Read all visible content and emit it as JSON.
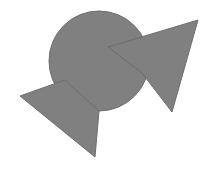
{
  "canvas": {
    "width": 216,
    "height": 174,
    "background_color": "#ffffff",
    "title": "Overlapping gray shapes figure"
  },
  "palette": {
    "shape_fill": "#808080",
    "shape_stroke": "#6e6e6e",
    "background": "#ffffff"
  },
  "shapes": [
    {
      "id": "circle",
      "name": "gray-circle",
      "type": "circle",
      "cx": 99,
      "cy": 61,
      "r": 50,
      "fill": "#808080",
      "stroke": "#6e6e6e",
      "stroke_width": 1
    },
    {
      "id": "right-arrow",
      "name": "gray-right-arrow",
      "type": "polygon",
      "points": "198,20 172,112 142,73 108,47",
      "fill": "#808080",
      "stroke": "#6e6e6e",
      "stroke_width": 1
    },
    {
      "id": "left-arrow",
      "name": "gray-left-arrow",
      "type": "polygon",
      "points": "20,96 95,157 99,111 65,80",
      "fill": "#808080",
      "stroke": "#6e6e6e",
      "stroke_width": 1
    }
  ]
}
